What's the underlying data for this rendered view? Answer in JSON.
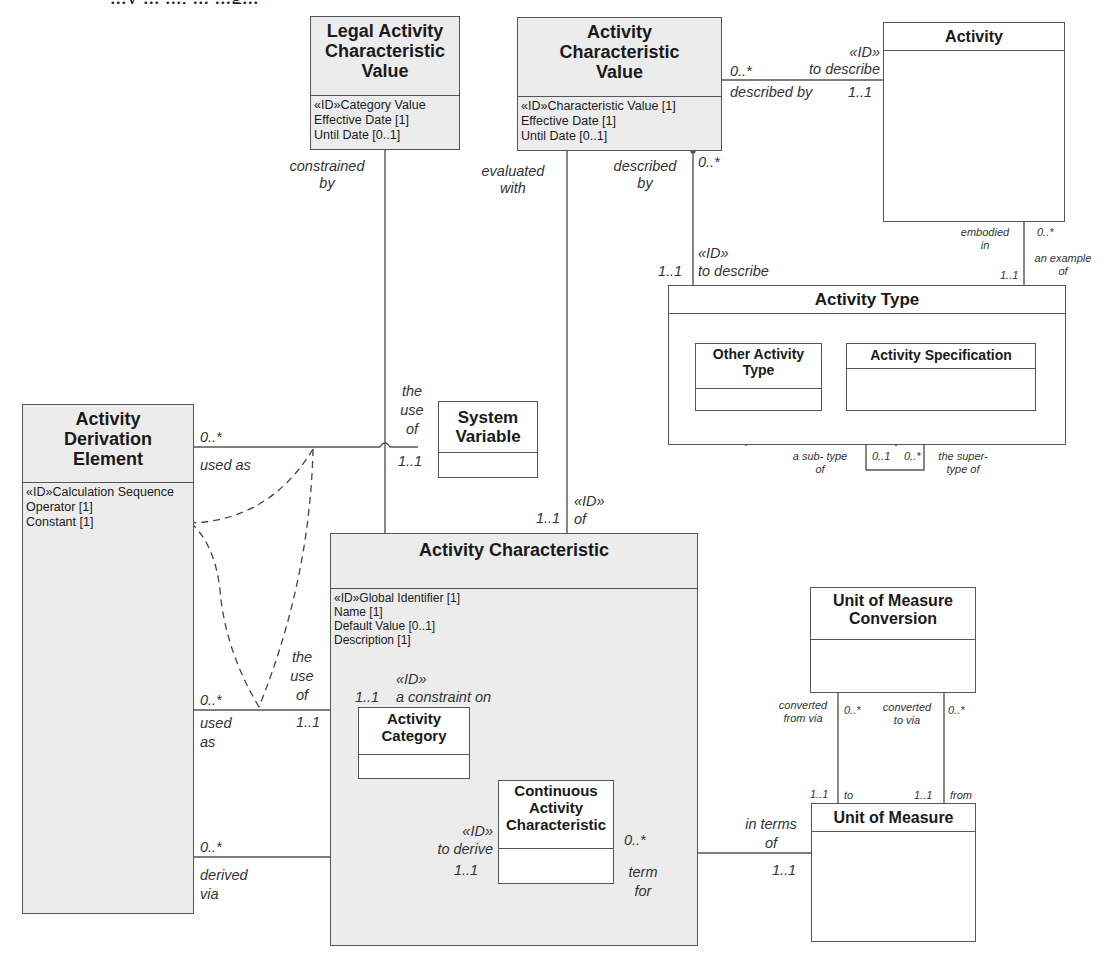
{
  "caption": "...y ... ..., ... ...g...",
  "classes": {
    "legal_acv": {
      "title": "Legal Activity Characteristic Value",
      "attrs": [
        "«ID»Category Value",
        "Effective Date [1]",
        "Until Date [0..1]"
      ]
    },
    "acv": {
      "title": "Activity Characteristic Value",
      "attrs": [
        "«ID»Characteristic Value [1]",
        "Effective Date [1]",
        "Until Date [0..1]"
      ]
    },
    "activity": {
      "title": "Activity",
      "attrs": []
    },
    "activity_type": {
      "title": "Activity Type",
      "attrs": []
    },
    "other_activity_type": {
      "title": "Other Activity Type",
      "attrs": []
    },
    "activity_spec": {
      "title": "Activity Specification",
      "attrs": []
    },
    "ade": {
      "title": "Activity Derivation Element",
      "attrs": [
        "«ID»Calculation Sequence",
        "Operator [1]",
        "Constant [1]"
      ]
    },
    "system_variable": {
      "title": "System Variable",
      "attrs": []
    },
    "activity_characteristic": {
      "title": "Activity Characteristic",
      "attrs": [
        "«ID»Global Identifier [1]",
        "Name [1]",
        "Default Value [0..1]",
        "Description [1]"
      ]
    },
    "activity_category": {
      "title": "Activity Category",
      "attrs": []
    },
    "continuous_ac": {
      "title": "Continuous Activity Characteristic",
      "attrs": []
    },
    "uom_conversion": {
      "title": "Unit of Measure Conversion",
      "attrs": []
    },
    "uom": {
      "title": "Unit of Measure",
      "attrs": []
    }
  },
  "labels": {
    "acv_activity_mult_left": "0..*",
    "acv_activity_role_top": "«ID»\nto describe",
    "acv_activity_role_bottom": "described by",
    "acv_activity_mult_right": "1..1",
    "legal_constrained_by": "constrained\nby",
    "acv_evaluated_with": "evaluated\nwith",
    "acv_described_by": "described\nby",
    "acv_at_mult_top": "0..*",
    "acv_at_mult_bottom": "1..1",
    "acv_at_role": "«ID»\nto describe",
    "activity_embodied_in": "embodied\nin",
    "activity_at_mult_bottom": "1..1",
    "activity_at_mult_top": "0..*",
    "activity_example_of": "an example\nof",
    "at_sub_type_of": "a sub- type\nof",
    "at_mult_01": "0..1",
    "at_mult_0n": "0..*",
    "at_super_type_of": "the super-\ntype of",
    "ade_sv_mult": "0..*",
    "ade_sv_used_as": "used as",
    "sv_the_use_of": "the\nuse\nof",
    "sv_mult": "1..1",
    "ac_of_mult": "1..1",
    "ac_of_role": "«ID»\nof",
    "ade_ac_mult": "0..*",
    "ade_ac_used_as": "used\nas",
    "ac_the_use_of": "the\nuse\nof",
    "ac_use_mult": "1..1",
    "cat_mult": "1..1",
    "cat_constraint": "«ID»\na constraint on",
    "ade_cac_mult": "0..*",
    "ade_derived_via": "derived\nvia",
    "cac_to_derive": "«ID»\nto derive",
    "cac_derive_mult": "1..1",
    "cac_uom_mult": "0..*",
    "cac_term_for": "term\nfor",
    "uom_in_terms_of": "in terms\nof",
    "uom_mult": "1..1",
    "conv_from_via": "converted\nfrom via",
    "conv_from_mult": "0..*",
    "conv_to_via": "converted\nto via",
    "conv_to_mult": "0..*",
    "uom_to_mult": "1..1",
    "uom_to": "to",
    "uom_from_mult": "1..1",
    "uom_from": "from"
  },
  "colors": {
    "line": "#555555",
    "shaded_fill": "#ececec",
    "box_fill": "#ffffff",
    "label": "#333333"
  }
}
